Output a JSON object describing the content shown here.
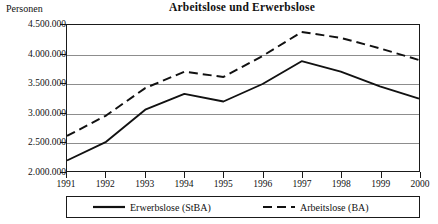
{
  "chart_data": {
    "type": "line",
    "title": "Arbeitslose und Erwerbslose",
    "xlabel": "",
    "ylabel": "Personen",
    "categories": [
      "1991",
      "1992",
      "1993",
      "1994",
      "1995",
      "1996",
      "1997",
      "1998",
      "1999",
      "2000"
    ],
    "ylim": [
      2000000,
      4500000
    ],
    "ytick_values": [
      2000000,
      2500000,
      3000000,
      3500000,
      4000000,
      4500000
    ],
    "ytick_labels": [
      "2.000.000",
      "2.500.000",
      "3.000.000",
      "3.500.000",
      "4.000.000",
      "4.500.000"
    ],
    "grid": true,
    "legend_position": "bottom",
    "series": [
      {
        "name": "Erwerbslose (StBA)",
        "style": "solid",
        "color": "#111111",
        "values": [
          2180000,
          2500000,
          3050000,
          3320000,
          3190000,
          3490000,
          3880000,
          3700000,
          3450000,
          3240000
        ]
      },
      {
        "name": "Arbeitslose (BA)",
        "style": "dashed",
        "color": "#111111",
        "values": [
          2600000,
          2950000,
          3420000,
          3700000,
          3610000,
          3970000,
          4380000,
          4280000,
          4100000,
          3900000
        ]
      }
    ]
  },
  "legend": {
    "items": [
      {
        "label": "Erwerbslose (StBA)",
        "style": "solid"
      },
      {
        "label": "Arbeitslose (BA)",
        "style": "dashed"
      }
    ]
  }
}
